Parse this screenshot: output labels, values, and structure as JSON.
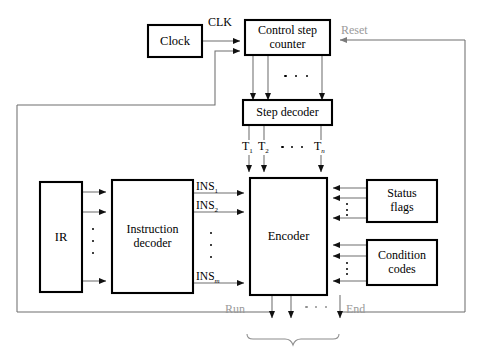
{
  "diagram": {
    "blocks": {
      "clock": "Clock",
      "control_step_counter_line1": "Control step",
      "control_step_counter_line2": "counter",
      "step_decoder": "Step decoder",
      "ir": "IR",
      "instruction_decoder_line1": "Instruction",
      "instruction_decoder_line2": "decoder",
      "encoder": "Encoder",
      "status_flags_line1": "Status",
      "status_flags_line2": "flags",
      "condition_codes_line1": "Condition",
      "condition_codes_line2": "codes"
    },
    "signals": {
      "clk": "CLK",
      "reset": "Reset",
      "run": "Run",
      "end": "End",
      "t1_base": "T",
      "t1_sub": "1",
      "t2_base": "T",
      "t2_sub": "2",
      "tn_base": "T",
      "tn_sub": "n",
      "ins1_base": "INS",
      "ins1_sub": "1",
      "ins2_base": "INS",
      "ins2_sub": "2",
      "insm_base": "INS",
      "insm_sub": "m",
      "ellipsis": "⋯"
    },
    "colors": {
      "block_stroke": "#000000",
      "signal_line": "#6f6f6f",
      "gray_label": "#9a9a9a",
      "background": "#ffffff"
    }
  }
}
